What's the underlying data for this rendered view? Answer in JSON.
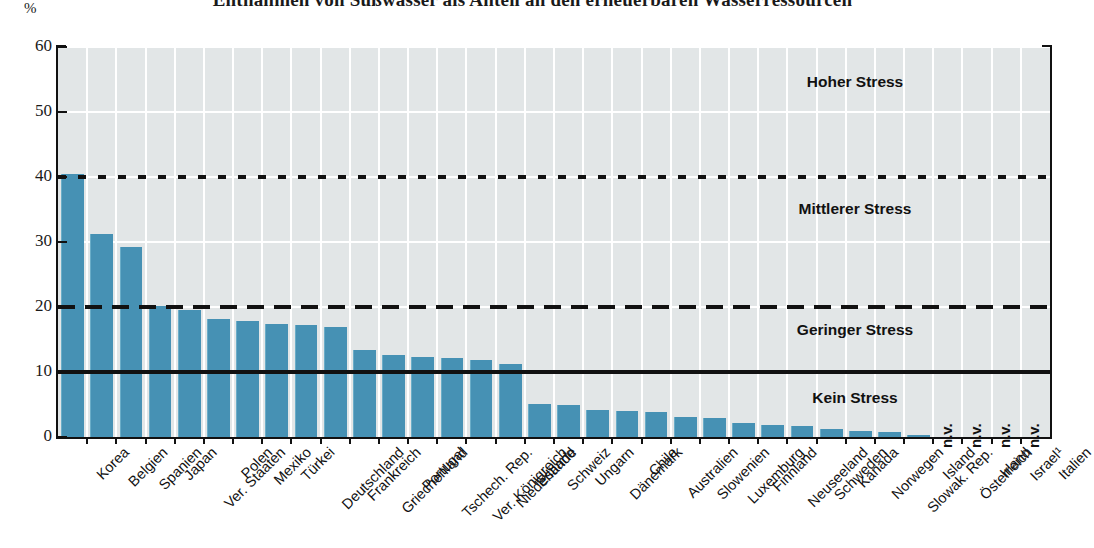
{
  "chart_data": {
    "type": "bar",
    "title": "Entnahmen von Süßwasser als Anteil an den erneuerbaren Wasserressourcen",
    "ylabel": "%",
    "xlabel": "",
    "ylim": [
      0,
      60
    ],
    "yticks": [
      0,
      10,
      20,
      30,
      40,
      50,
      60
    ],
    "grid": "horizontal-and-vertical-white",
    "legend": "none",
    "categories": [
      "Korea",
      "Belgien",
      "Spanien",
      "Japan",
      "Ver. Staaten",
      "Polen",
      "Mexiko",
      "Türkei",
      "Deutschland",
      "Frankreich",
      "Griechenland",
      "Portugal",
      "Tschech. Rep.",
      "Ver. Königreich",
      "Niederlande",
      "Estland",
      "Schweiz",
      "Ungarn",
      "Dänemark",
      "Chile",
      "Australien",
      "Slowenien",
      "Luxemburg",
      "Finnland",
      "Neuseeland",
      "Schweden",
      "Kanada",
      "Norwegen",
      "Slowak. Rep.",
      "Island",
      "Österreich",
      "Irland",
      "Israel¹",
      "Italien"
    ],
    "values": [
      40.5,
      31.3,
      29.3,
      20.1,
      19.5,
      18.2,
      17.9,
      17.4,
      17.2,
      16.9,
      13.4,
      12.6,
      12.3,
      12.1,
      11.9,
      11.3,
      5.1,
      5.0,
      4.2,
      4.0,
      3.9,
      3.1,
      3.0,
      2.2,
      1.8,
      1.7,
      1.3,
      0.9,
      0.8,
      0.1,
      null,
      null,
      null,
      null
    ],
    "missing_label": "n.v.",
    "missing_categories": [
      "Österreich",
      "Irland",
      "Israel¹",
      "Italien"
    ],
    "bar_color": "#4691b4",
    "plot_bg": "#e2e6e7",
    "thresholds": [
      {
        "name": "hoher-stress-threshold",
        "value": 40,
        "style": "dotted"
      },
      {
        "name": "mittlerer-stress-threshold",
        "value": 20,
        "style": "dashed"
      },
      {
        "name": "geringer-stress-threshold",
        "value": 10,
        "style": "solid"
      }
    ],
    "zones": [
      {
        "label": "Hoher Stress",
        "y": 54.5
      },
      {
        "label": "Mittlerer Stress",
        "y": 35.0
      },
      {
        "label": "Geringer Stress",
        "y": 16.3
      },
      {
        "label": "Kein Stress",
        "y": 5.9
      }
    ]
  }
}
